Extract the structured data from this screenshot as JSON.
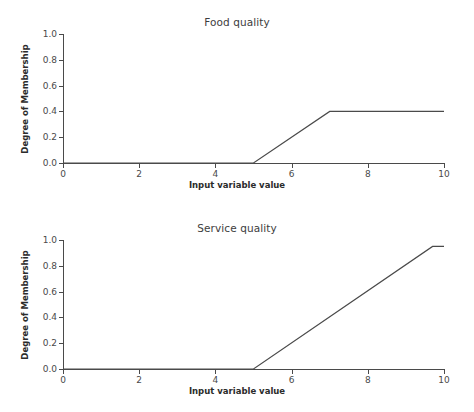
{
  "figure": {
    "background_color": "#ffffff",
    "line_color": "#4a4a4a",
    "axis_color": "#4a4a4a",
    "text_color": "#3d3d3d"
  },
  "panels": [
    {
      "id": "food",
      "title": "Food quality",
      "xlabel": "Input variable value",
      "ylabel": "Degree of Membership"
    },
    {
      "id": "service",
      "title": "Service quality",
      "xlabel": "Input variable value",
      "ylabel": "Degree of Membership"
    }
  ],
  "chart_data": [
    {
      "type": "line",
      "title": "Food quality",
      "xlabel": "Input variable value",
      "ylabel": "Degree of Membership",
      "xlim": [
        0,
        10
      ],
      "ylim": [
        0,
        1.0
      ],
      "xticks": [
        0,
        2,
        4,
        6,
        8,
        10
      ],
      "xtick_labels": [
        "0",
        "2",
        "4",
        "6",
        "8",
        "10"
      ],
      "yticks": [
        0.0,
        0.2,
        0.4,
        0.6,
        0.8,
        1.0
      ],
      "ytick_labels": [
        "0.0",
        "0.2",
        "0.4",
        "0.6",
        "0.8",
        "1.0"
      ],
      "grid": false,
      "legend": null,
      "series": [
        {
          "name": "food membership",
          "color": "#4a4a4a",
          "x": [
            0,
            5,
            7,
            10
          ],
          "y": [
            0.0,
            0.0,
            0.4,
            0.4
          ]
        }
      ]
    },
    {
      "type": "line",
      "title": "Service quality",
      "xlabel": "Input variable value",
      "ylabel": "Degree of Membership",
      "xlim": [
        0,
        10
      ],
      "ylim": [
        0,
        1.0
      ],
      "xticks": [
        0,
        2,
        4,
        6,
        8,
        10
      ],
      "xtick_labels": [
        "0",
        "2",
        "4",
        "6",
        "8",
        "10"
      ],
      "yticks": [
        0.0,
        0.2,
        0.4,
        0.6,
        0.8,
        1.0
      ],
      "ytick_labels": [
        "0.0",
        "0.2",
        "0.4",
        "0.6",
        "0.8",
        "1.0"
      ],
      "grid": false,
      "legend": null,
      "series": [
        {
          "name": "service membership",
          "color": "#4a4a4a",
          "x": [
            0,
            5,
            9.7,
            10
          ],
          "y": [
            0.0,
            0.0,
            0.95,
            0.95
          ]
        }
      ]
    }
  ]
}
